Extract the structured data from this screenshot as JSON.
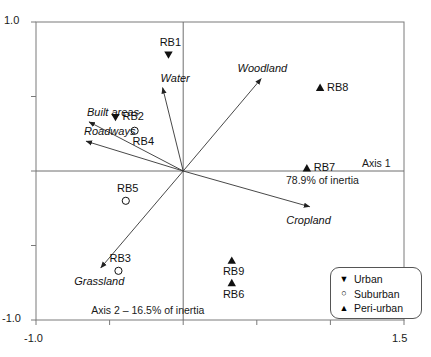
{
  "chart_data": {
    "type": "scatter",
    "title": "",
    "subtitle": "",
    "xlabel": "Axis 1 – 78.9% of inertia",
    "ylabel": "Axis 2 – 16.5% of inertia",
    "axis1_caption": "Axis 1",
    "axis1_inertia": "78.9% of inertia",
    "axis2_caption": "Axis 2 – 16.5% of inertia",
    "xlim": [
      -1.0,
      1.5
    ],
    "ylim": [
      -1.0,
      1.0
    ],
    "xticks": [
      -1.0,
      1.5
    ],
    "yticks": [
      -1.0,
      1.0
    ],
    "xtick_labels": [
      "-1.0",
      "1.5"
    ],
    "ytick_labels": [
      "-1.0",
      "1.0"
    ],
    "grid": false,
    "origin": [
      0.0,
      0.0
    ],
    "legend_position": "bottom-right",
    "groups": [
      {
        "name": "Urban",
        "marker": "triangle-down-filled"
      },
      {
        "name": "Suburban",
        "marker": "circle-open"
      },
      {
        "name": "Peri-urban",
        "marker": "triangle-up-filled"
      }
    ],
    "points": [
      {
        "label": "RB1",
        "group": "Urban",
        "x": -0.1,
        "y": 0.78,
        "label_pos": "above"
      },
      {
        "label": "RB2",
        "group": "Urban",
        "x": -0.46,
        "y": 0.36,
        "label_pos": "right"
      },
      {
        "label": "RB4",
        "group": "Suburban",
        "x": -0.33,
        "y": 0.27,
        "label_pos": "below-right"
      },
      {
        "label": "RB5",
        "group": "Suburban",
        "x": -0.39,
        "y": -0.2,
        "label_pos": "above"
      },
      {
        "label": "RB3",
        "group": "Suburban",
        "x": -0.44,
        "y": -0.67,
        "label_pos": "above"
      },
      {
        "label": "RB9",
        "group": "Peri-urban",
        "x": 0.33,
        "y": -0.6,
        "label_pos": "below"
      },
      {
        "label": "RB6",
        "group": "Peri-urban",
        "x": 0.33,
        "y": -0.75,
        "label_pos": "below"
      },
      {
        "label": "RB7",
        "group": "Peri-urban",
        "x": 0.84,
        "y": 0.02,
        "label_pos": "right"
      },
      {
        "label": "RB8",
        "group": "Peri-urban",
        "x": 0.93,
        "y": 0.56,
        "label_pos": "right"
      }
    ],
    "vectors": [
      {
        "label": "Built areas",
        "x": -0.64,
        "y": 0.33,
        "label_pos": "above-right"
      },
      {
        "label": "Roadways",
        "x": -0.66,
        "y": 0.2,
        "label_pos": "above-right"
      },
      {
        "label": "Water",
        "x": -0.14,
        "y": 0.56,
        "label_pos": "above-right"
      },
      {
        "label": "Woodland",
        "x": 0.53,
        "y": 0.62,
        "label_pos": "above"
      },
      {
        "label": "Cropland",
        "x": 0.86,
        "y": -0.24,
        "label_pos": "below"
      },
      {
        "label": "Grassland",
        "x": -0.56,
        "y": -0.65,
        "label_pos": "below"
      }
    ]
  },
  "legend": {
    "items": [
      {
        "glyph": "▼",
        "label": "Urban"
      },
      {
        "glyph": "○",
        "label": "Suburban"
      },
      {
        "glyph": "▲",
        "label": "Peri-urban"
      }
    ]
  },
  "axes": {
    "y_top_label": "1.0",
    "y_bottom_label": "-1.0",
    "x_left_label": "-1.0",
    "x_right_label": "1.5",
    "axis1_label": "Axis 1",
    "axis1_inertia_label": "78.9% of inertia",
    "axis2_label": "Axis 2 – 16.5% of inertia"
  }
}
